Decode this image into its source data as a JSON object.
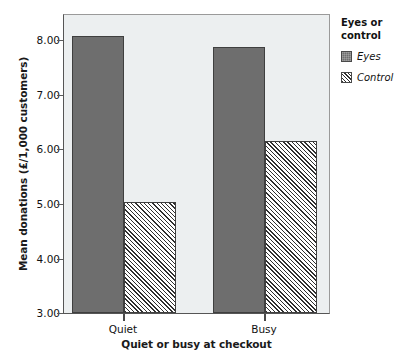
{
  "chart_data": {
    "type": "bar",
    "title": "",
    "categories": [
      "Quiet",
      "Busy"
    ],
    "series": [
      {
        "name": "Eyes",
        "values": [
          8.0,
          7.8
        ]
      },
      {
        "name": "Control",
        "values": [
          5.0,
          6.1
        ]
      }
    ],
    "xlabel": "Quiet or busy at checkout",
    "ylabel": "Mean donations (£/1,000 customers)",
    "ylim": [
      3.0,
      8.4
    ],
    "ytick_labels": [
      "8.00",
      "7.00",
      "6.00",
      "5.00",
      "4.00",
      "3.00"
    ],
    "ytick_values": [
      8.0,
      7.0,
      6.0,
      5.0,
      4.0,
      3.0
    ],
    "grid": false,
    "legend_position": "right",
    "colors": {
      "eyes_fill": "#6e6e6e",
      "control_fill": "#ffffff",
      "control_hatch": "#2f2f2f",
      "plot_background": "#eceff0",
      "axis": "#555555",
      "text": "#111111"
    }
  },
  "legend": {
    "title": "Eyes or\ncontrol",
    "items": [
      {
        "label": "Eyes",
        "swatch": "solid-dark-square-icon"
      },
      {
        "label": "Control",
        "swatch": "diagonal-hatch-square-icon"
      }
    ]
  },
  "axes": {
    "y_title": "Mean donations (£/1,000 customers)",
    "x_title": "Quiet or busy at checkout",
    "y_ticks": [
      "8.00",
      "7.00",
      "6.00",
      "5.00",
      "4.00",
      "3.00"
    ],
    "x_ticks": [
      "Quiet",
      "Busy"
    ]
  }
}
